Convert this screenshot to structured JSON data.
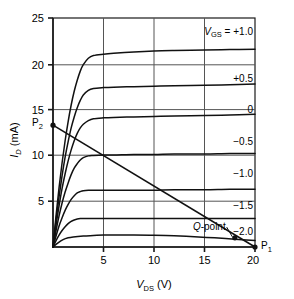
{
  "chart_data": {
    "type": "line",
    "title": "",
    "xlabel": "V_DS (V)",
    "xlabel_main": "V",
    "xlabel_sub": "DS",
    "xlabel_unit": " (V)",
    "ylabel": "I_D (mA)",
    "ylabel_main": "I",
    "ylabel_sub": "D",
    "ylabel_unit": " (mA)",
    "xlim": [
      0,
      20
    ],
    "ylim": [
      0,
      25
    ],
    "xticks": [
      5,
      10,
      15,
      20
    ],
    "yticks": [
      5,
      10,
      15,
      20,
      25
    ],
    "xtick_labels": [
      "5",
      "10",
      "15",
      "20"
    ],
    "ytick_labels": [
      "5",
      "10",
      "15",
      "20",
      "25"
    ],
    "grid": true,
    "legend_position": "right-inline",
    "family_variable": "V_GS",
    "family_variable_main": "V",
    "family_variable_sub": "GS",
    "header_label": "V_GS = +1.0",
    "header_prefix": " = ",
    "series": [
      {
        "name": "+1.0",
        "label": "+1.0",
        "label_x": 20.0,
        "label_y": 24.0,
        "vgs": 1.0,
        "idss": 21.6,
        "vp": 3.0,
        "points": [
          [
            0,
            0
          ],
          [
            0.3,
            3.4
          ],
          [
            0.6,
            6.5
          ],
          [
            0.9,
            9.2
          ],
          [
            1.2,
            11.6
          ],
          [
            1.5,
            13.7
          ],
          [
            1.8,
            15.5
          ],
          [
            2.1,
            17.0
          ],
          [
            2.4,
            18.2
          ],
          [
            2.7,
            19.2
          ],
          [
            3.0,
            19.9
          ],
          [
            3.5,
            20.6
          ],
          [
            4.0,
            20.9
          ],
          [
            5.0,
            21.05
          ],
          [
            6.0,
            21.15
          ],
          [
            8.0,
            21.3
          ],
          [
            10.0,
            21.4
          ],
          [
            12.0,
            21.45
          ],
          [
            15.0,
            21.5
          ],
          [
            17.5,
            21.55
          ],
          [
            20.0,
            21.6
          ]
        ]
      },
      {
        "name": "+0.5",
        "label": "+0.5",
        "label_x": 20.0,
        "label_y": 18.4,
        "vgs": 0.5,
        "idss": 17.8,
        "vp": 2.8,
        "points": [
          [
            0,
            0
          ],
          [
            0.3,
            2.9
          ],
          [
            0.6,
            5.5
          ],
          [
            0.9,
            7.8
          ],
          [
            1.2,
            9.8
          ],
          [
            1.5,
            11.5
          ],
          [
            1.8,
            13.0
          ],
          [
            2.1,
            14.2
          ],
          [
            2.4,
            15.2
          ],
          [
            2.7,
            16.0
          ],
          [
            3.0,
            16.6
          ],
          [
            3.5,
            17.1
          ],
          [
            4.0,
            17.3
          ],
          [
            5.0,
            17.4
          ],
          [
            6.0,
            17.45
          ],
          [
            8.0,
            17.5
          ],
          [
            10.0,
            17.55
          ],
          [
            12.0,
            17.6
          ],
          [
            15.0,
            17.65
          ],
          [
            17.5,
            17.7
          ],
          [
            20.0,
            17.8
          ]
        ]
      },
      {
        "name": "0",
        "label": "0",
        "label_x": 20.0,
        "label_y": 15.0,
        "vgs": 0.0,
        "idss": 14.5,
        "vp": 2.6,
        "points": [
          [
            0,
            0
          ],
          [
            0.3,
            2.4
          ],
          [
            0.6,
            4.5
          ],
          [
            0.9,
            6.4
          ],
          [
            1.2,
            8.0
          ],
          [
            1.5,
            9.4
          ],
          [
            1.8,
            10.6
          ],
          [
            2.1,
            11.6
          ],
          [
            2.4,
            12.4
          ],
          [
            2.7,
            13.0
          ],
          [
            3.0,
            13.4
          ],
          [
            3.5,
            13.8
          ],
          [
            4.0,
            14.0
          ],
          [
            5.0,
            14.1
          ],
          [
            6.0,
            14.15
          ],
          [
            8.0,
            14.2
          ],
          [
            10.0,
            14.25
          ],
          [
            12.0,
            14.3
          ],
          [
            15.0,
            14.35
          ],
          [
            17.5,
            14.4
          ],
          [
            20.0,
            14.5
          ]
        ]
      },
      {
        "name": "-0.5",
        "label": "−0.5",
        "label_x": 20.0,
        "label_y": 11.5,
        "vgs": -0.5,
        "idss": 10.2,
        "vp": 2.4,
        "points": [
          [
            0,
            0
          ],
          [
            0.3,
            1.8
          ],
          [
            0.6,
            3.4
          ],
          [
            0.9,
            4.8
          ],
          [
            1.2,
            6.0
          ],
          [
            1.5,
            7.0
          ],
          [
            1.8,
            7.9
          ],
          [
            2.1,
            8.6
          ],
          [
            2.4,
            9.1
          ],
          [
            2.7,
            9.5
          ],
          [
            3.0,
            9.75
          ],
          [
            3.5,
            9.95
          ],
          [
            4.0,
            10.0
          ],
          [
            5.0,
            10.05
          ],
          [
            6.0,
            10.05
          ],
          [
            8.0,
            10.1
          ],
          [
            10.0,
            10.1
          ],
          [
            12.0,
            10.15
          ],
          [
            15.0,
            10.15
          ],
          [
            17.5,
            10.2
          ],
          [
            20.0,
            10.2
          ]
        ]
      },
      {
        "name": "-1.0",
        "label": "−1.0",
        "label_x": 20.0,
        "label_y": 8.0,
        "vgs": -1.0,
        "idss": 6.3,
        "vp": 2.2,
        "points": [
          [
            0,
            0
          ],
          [
            0.3,
            1.2
          ],
          [
            0.6,
            2.3
          ],
          [
            0.9,
            3.2
          ],
          [
            1.2,
            4.0
          ],
          [
            1.5,
            4.65
          ],
          [
            1.8,
            5.2
          ],
          [
            2.1,
            5.6
          ],
          [
            2.4,
            5.9
          ],
          [
            2.7,
            6.05
          ],
          [
            3.0,
            6.15
          ],
          [
            3.5,
            6.2
          ],
          [
            4.0,
            6.2
          ],
          [
            5.0,
            6.2
          ],
          [
            6.0,
            6.2
          ],
          [
            8.0,
            6.2
          ],
          [
            10.0,
            6.2
          ],
          [
            12.0,
            6.25
          ],
          [
            15.0,
            6.25
          ],
          [
            17.5,
            6.3
          ],
          [
            20.0,
            6.3
          ]
        ]
      },
      {
        "name": "-1.5",
        "label": "−1.5",
        "label_x": 20.0,
        "label_y": 4.5,
        "vgs": -1.5,
        "idss": 3.1,
        "vp": 1.9,
        "points": [
          [
            0,
            0
          ],
          [
            0.3,
            0.7
          ],
          [
            0.6,
            1.3
          ],
          [
            0.9,
            1.8
          ],
          [
            1.2,
            2.2
          ],
          [
            1.5,
            2.55
          ],
          [
            1.8,
            2.8
          ],
          [
            2.1,
            2.95
          ],
          [
            2.4,
            3.05
          ],
          [
            2.7,
            3.1
          ],
          [
            3.0,
            3.1
          ],
          [
            3.5,
            3.1
          ],
          [
            4.0,
            3.1
          ],
          [
            5.0,
            3.1
          ],
          [
            6.0,
            3.1
          ],
          [
            8.0,
            3.1
          ],
          [
            10.0,
            3.1
          ],
          [
            12.0,
            3.1
          ],
          [
            15.0,
            3.1
          ],
          [
            17.5,
            3.1
          ],
          [
            20.0,
            3.1
          ]
        ]
      },
      {
        "name": "-2.0",
        "label": "−2.0",
        "label_x": 20.0,
        "label_y": 1.7,
        "vgs": -2.0,
        "idss": 1.1,
        "vp": 1.5,
        "points": [
          [
            0,
            0
          ],
          [
            0.5,
            0.45
          ],
          [
            1.0,
            0.8
          ],
          [
            1.5,
            1.0
          ],
          [
            2.0,
            1.1
          ],
          [
            3.0,
            1.2
          ],
          [
            4.0,
            1.25
          ],
          [
            5.0,
            1.3
          ],
          [
            6.0,
            1.3
          ],
          [
            8.0,
            1.3
          ],
          [
            10.0,
            1.28
          ],
          [
            12.0,
            1.22
          ],
          [
            14.0,
            1.12
          ],
          [
            16.0,
            1.0
          ],
          [
            18.0,
            0.85
          ],
          [
            20.0,
            0.7
          ]
        ]
      }
    ],
    "loadline": {
      "name": "dc-load-line",
      "from": [
        0,
        13.3
      ],
      "to": [
        20,
        0
      ],
      "endpoints": [
        {
          "name": "P2",
          "label": "P",
          "sub": "2",
          "x": 0,
          "y": 13.3,
          "label_side": "left"
        },
        {
          "name": "P1",
          "label": "P",
          "sub": "1",
          "x": 20,
          "y": 0,
          "label_side": "right"
        }
      ]
    },
    "annotations": [
      {
        "name": "q-point",
        "label": "Q-point",
        "label_italic_part": "Q",
        "label_rest": "-point",
        "x": 18.0,
        "y": 1.0,
        "text_x": 17.0,
        "text_y": 1.95
      }
    ],
    "colors": {
      "curve": "#111111",
      "grid": "#555555",
      "axis": "#1a1a1a",
      "background": "#ffffff",
      "text": "#000000"
    }
  }
}
